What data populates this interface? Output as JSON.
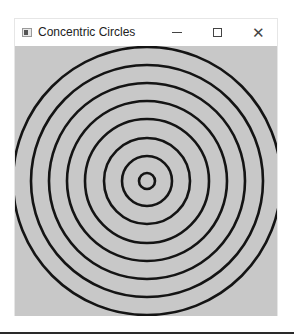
{
  "window": {
    "title": "Concentric Circles",
    "app_icon": "window-app-icon",
    "controls": {
      "minimize": "minimize-icon",
      "maximize": "maximize-icon",
      "close": "close-icon",
      "close_glyph": "✕"
    }
  },
  "canvas": {
    "background": "#c8c8c8",
    "stroke": "#141414",
    "stroke_width": 2.6,
    "center": [
      132,
      135
    ],
    "radii": [
      8,
      25,
      43,
      62,
      80,
      98,
      116,
      134
    ]
  }
}
